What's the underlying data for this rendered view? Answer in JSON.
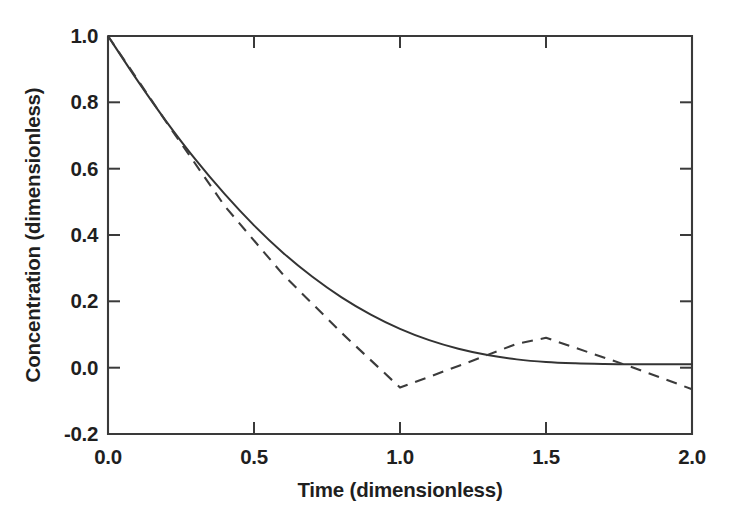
{
  "chart_data": {
    "type": "line",
    "title": "",
    "xlabel": "Time (dimensionless)",
    "ylabel": "Concentration (dimensionless)",
    "xlim": [
      0.0,
      2.0
    ],
    "ylim": [
      -0.2,
      1.0
    ],
    "xticks": [
      "0.0",
      "0.5",
      "1.0",
      "1.5",
      "2.0"
    ],
    "xtick_values": [
      0.0,
      0.5,
      1.0,
      1.5,
      2.0
    ],
    "yticks": [
      "1.0",
      "0.8",
      "0.6",
      "0.4",
      "0.2",
      "0.0",
      "-0.2"
    ],
    "ytick_values": [
      1.0,
      0.8,
      0.6,
      0.4,
      0.2,
      0.0,
      -0.2
    ],
    "grid": false,
    "legend": "none",
    "series": [
      {
        "name": "exact-solution",
        "style": "solid",
        "color": "#333333",
        "x": [
          0.0,
          0.1,
          0.2,
          0.3,
          0.4,
          0.5,
          0.6,
          0.7,
          0.8,
          0.9,
          1.0,
          1.1,
          1.2,
          1.3,
          1.4,
          1.5,
          1.6,
          1.7,
          1.8,
          1.9,
          2.0
        ],
        "y": [
          1.0,
          0.867,
          0.742,
          0.627,
          0.523,
          0.429,
          0.346,
          0.274,
          0.212,
          0.16,
          0.117,
          0.083,
          0.057,
          0.038,
          0.025,
          0.017,
          0.013,
          0.011,
          0.01,
          0.01,
          0.01
        ]
      },
      {
        "name": "numerical-solution",
        "style": "dashed",
        "color": "#3b3b3b",
        "x": [
          0.0,
          0.2,
          0.4,
          0.6,
          0.8,
          1.0,
          1.2,
          1.4,
          1.5,
          1.6,
          1.8,
          2.0
        ],
        "y": [
          1.0,
          0.74,
          0.487,
          0.28,
          0.105,
          -0.06,
          0.005,
          0.072,
          0.09,
          0.06,
          0.0,
          -0.065
        ]
      }
    ]
  },
  "axis_labels": {
    "x_title": "Time (dimensionless)",
    "y_title": "Concentration (dimensionless)"
  },
  "colors": {
    "background": "#ffffff",
    "axis": "#3a3a3a",
    "text": "#1f1f1f",
    "solid_series": "#333333",
    "dashed_series": "#3b3b3b"
  }
}
